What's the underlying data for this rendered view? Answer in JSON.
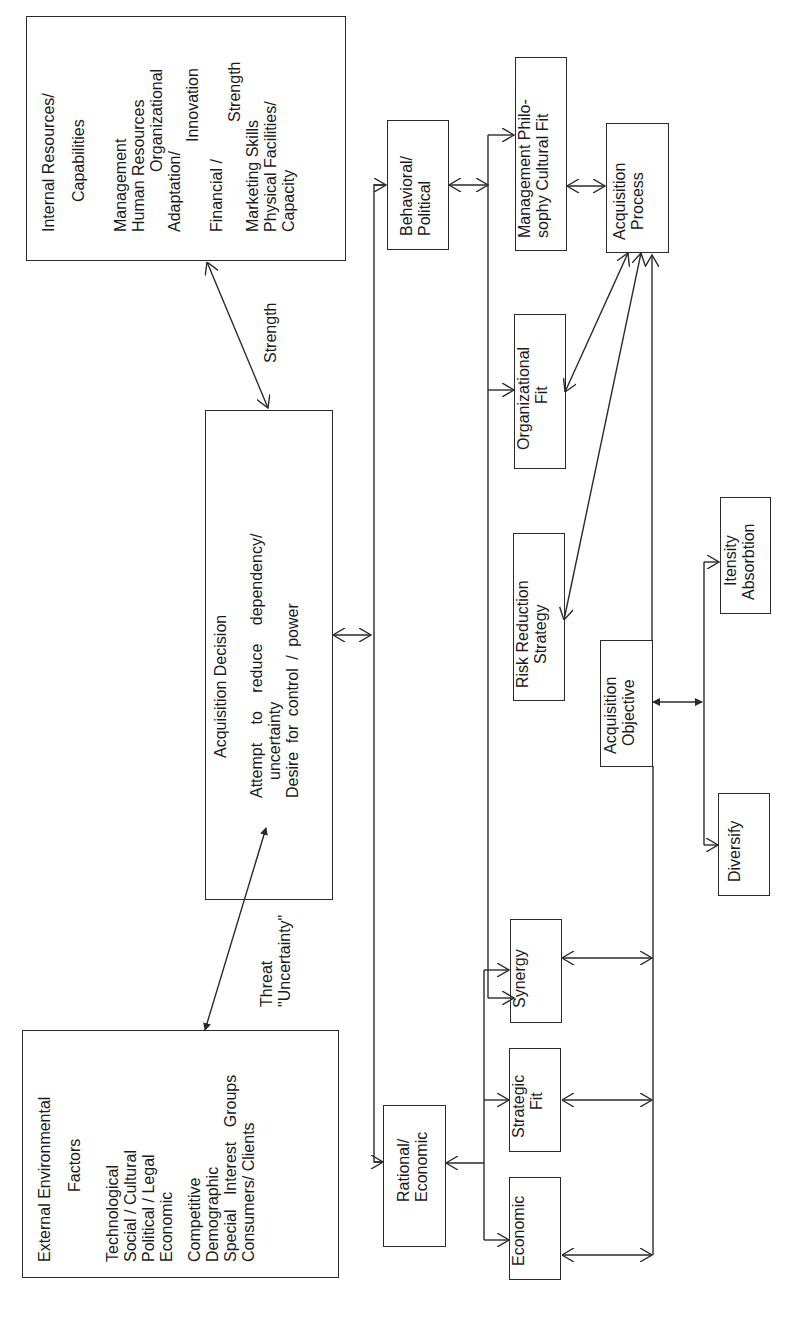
{
  "diagram": {
    "internal_resources": {
      "title": "Internal Resources/",
      "subtitle": "Capabilities",
      "items": [
        "Management",
        "Human Resources",
        "Organizational",
        "Adaptation/",
        "Innovation",
        "Financial /",
        "Strength",
        "Marketing Skills",
        "Physical Facilities/",
        "Capacity"
      ]
    },
    "strength_label": "Strength",
    "acquisition_decision": {
      "title": "Acquisition Decision",
      "lines": [
        "Attempt to reduce dependency/",
        "uncertainty",
        "Desire for control / power"
      ]
    },
    "threat_label": {
      "line1": "Threat",
      "line2": "\"Uncertainty\""
    },
    "external_factors": {
      "title": "External Environmental",
      "subtitle": "Factors",
      "group1": [
        "Technological",
        "Social / Cultural",
        "Political / Legal",
        "Economic"
      ],
      "group2": [
        "Competitive",
        "Demographic",
        "Special Interest Groups",
        "Consumers/ Clients"
      ]
    },
    "behavioral_political": {
      "line1": "Behavioral/",
      "line2": "Political"
    },
    "rational_economic": {
      "line1": "Rational/",
      "line2": "Economic"
    },
    "management_philosophy": {
      "line1": "Management Philo-",
      "line2": "sophy Cultural Fit"
    },
    "acquisition_process": {
      "line1": "Acquisition",
      "line2": "Process"
    },
    "organizational_fit": {
      "line1": "Organizational",
      "line2": "Fit"
    },
    "risk_reduction": {
      "line1": "Risk Reduction",
      "line2": "Strategy"
    },
    "acquisition_objective": {
      "line1": "Acquisition",
      "line2": "Objective"
    },
    "itensity_absorbtion": {
      "line1": "Itensity",
      "line2": "Absorbtion"
    },
    "diversify": {
      "label": "Diversify"
    },
    "economic": {
      "label": "Economic"
    },
    "strategic_fit": {
      "line1": "Strategic",
      "line2": "Fit"
    },
    "synergy": {
      "label": "Synergy"
    },
    "colors": {
      "stroke": "#2a2a2a",
      "background": "#ffffff"
    }
  }
}
